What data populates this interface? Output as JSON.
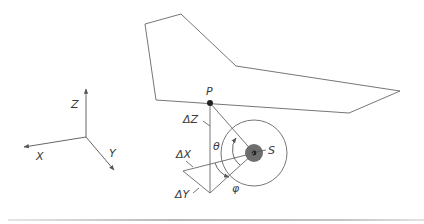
{
  "diagram": {
    "axes": {
      "x_label": "X",
      "y_label": "Y",
      "z_label": "Z"
    },
    "points": {
      "p_label": "P",
      "s_label": "S"
    },
    "offsets": {
      "dx_label": "ΔX",
      "dy_label": "ΔY",
      "dz_label": "ΔZ"
    },
    "angles": {
      "theta_label": "θ",
      "phi_label": "φ"
    },
    "colors": {
      "line": "#555555",
      "point_fill": "#222222",
      "source_core": "#6e6e6e",
      "source_ring": "#444444"
    }
  }
}
